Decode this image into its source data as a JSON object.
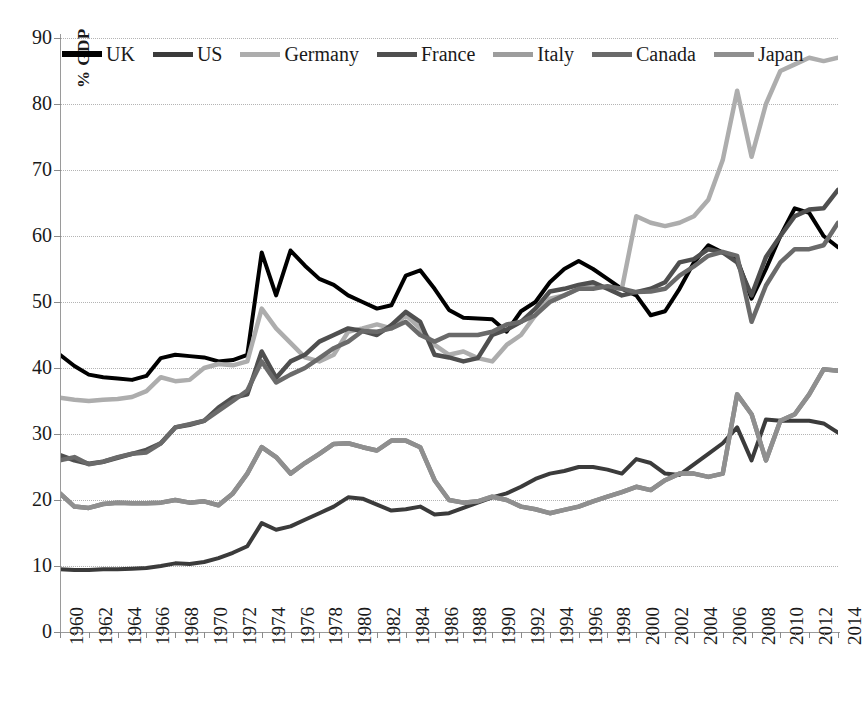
{
  "chart_data": {
    "type": "line",
    "title": "",
    "subtitle": "",
    "xlabel": "",
    "ylabel": "% GDP",
    "ylim": [
      0,
      90
    ],
    "xlim": [
      1960,
      2014
    ],
    "ytick_step": 10,
    "xtick_step": 2,
    "grid": true,
    "grid_style": "dotted-horizontal",
    "legend_position": "top-inside",
    "yticks": [
      0,
      10,
      20,
      30,
      40,
      50,
      60,
      70,
      80,
      90
    ],
    "xticks": [
      1960,
      1962,
      1964,
      1966,
      1968,
      1970,
      1972,
      1974,
      1976,
      1978,
      1980,
      1982,
      1984,
      1986,
      1988,
      1990,
      1992,
      1994,
      1996,
      1998,
      2000,
      2002,
      2004,
      2006,
      2008,
      2010,
      2012,
      2014
    ],
    "x": [
      1960,
      1961,
      1962,
      1963,
      1964,
      1965,
      1966,
      1967,
      1968,
      1969,
      1970,
      1971,
      1972,
      1973,
      1974,
      1975,
      1976,
      1977,
      1978,
      1979,
      1980,
      1981,
      1982,
      1983,
      1984,
      1985,
      1986,
      1987,
      1988,
      1989,
      1990,
      1991,
      1992,
      1993,
      1994,
      1995,
      1996,
      1997,
      1998,
      1999,
      2000,
      2001,
      2002,
      2003,
      2004,
      2005,
      2006,
      2007,
      2008,
      2009,
      2010,
      2011,
      2012,
      2013,
      2014
    ],
    "series": [
      {
        "name": "UK",
        "color": "#000000",
        "width": 4.0,
        "values": [
          42.0,
          40.3,
          39.0,
          38.6,
          38.4,
          38.2,
          38.8,
          41.5,
          42.0,
          41.8,
          41.6,
          41.0,
          41.2,
          42.0,
          57.5,
          51.0,
          57.8,
          55.5,
          53.5,
          52.6,
          51.0,
          50.0,
          49.0,
          49.5,
          54.0,
          54.8,
          52.0,
          48.8,
          47.6,
          47.5,
          47.4,
          45.5,
          48.6,
          50.0,
          53.0,
          55.0,
          56.2,
          55.0,
          53.5,
          52.0,
          51.0,
          48.0,
          48.6,
          52.0,
          56.0,
          58.6,
          57.5,
          56.5,
          50.5,
          55.0,
          60.0,
          64.2,
          63.5,
          60.0,
          58.3
        ]
      },
      {
        "name": "US",
        "color": "#3b3b3b",
        "width": 4.0,
        "values": [
          9.5,
          9.4,
          9.4,
          9.5,
          9.5,
          9.6,
          9.7,
          10.0,
          10.4,
          10.3,
          10.6,
          11.2,
          12.0,
          13.0,
          16.5,
          15.5,
          16.0,
          17.0,
          18.0,
          19.0,
          20.4,
          20.2,
          19.3,
          18.4,
          18.6,
          19.0,
          17.8,
          18.0,
          18.8,
          19.6,
          20.4,
          21.0,
          22.0,
          23.2,
          24.0,
          24.4,
          25.0,
          25.0,
          24.6,
          24.0,
          26.2,
          25.6,
          24.0,
          23.8,
          25.4,
          27.0,
          28.6,
          31.0,
          26.0,
          32.2,
          32.0,
          32.0,
          32.0,
          31.6,
          30.2
        ]
      },
      {
        "name": "Germany",
        "color": "#adadad",
        "width": 4.5,
        "values": [
          35.5,
          35.2,
          35.0,
          35.2,
          35.3,
          35.6,
          36.5,
          38.6,
          38.0,
          38.2,
          40.0,
          40.6,
          40.4,
          41.0,
          49.0,
          46.0,
          43.8,
          41.6,
          41.0,
          42.0,
          45.5,
          46.0,
          46.6,
          46.0,
          48.0,
          46.0,
          43.5,
          42.0,
          42.5,
          41.5,
          41.0,
          43.5,
          45.0,
          48.0,
          50.5,
          51.0,
          52.0,
          52.4,
          52.2,
          52.0,
          63.0,
          62.0,
          61.5,
          62.0,
          63.0,
          65.5,
          71.5,
          82.0,
          72.0,
          80.0,
          85.0,
          86.0,
          87.0,
          86.5,
          87.0
        ]
      },
      {
        "name": "France",
        "color": "#4f4f4f",
        "width": 4.5,
        "values": [
          26.8,
          26.0,
          25.5,
          25.8,
          26.4,
          27.0,
          27.6,
          28.6,
          31.0,
          31.4,
          32.0,
          34.0,
          35.5,
          36.0,
          42.5,
          38.5,
          41.0,
          42.0,
          44.0,
          45.0,
          46.0,
          45.6,
          45.0,
          46.5,
          48.5,
          47.0,
          42.0,
          41.6,
          41.0,
          41.5,
          45.0,
          45.8,
          47.0,
          49.0,
          51.6,
          52.0,
          52.6,
          53.0,
          52.0,
          51.0,
          51.5,
          52.0,
          53.0,
          56.0,
          56.5,
          58.0,
          57.5,
          56.0,
          51.0,
          56.8,
          60.0,
          63.0,
          64.0,
          64.2,
          67.0
        ]
      },
      {
        "name": "Italy",
        "color": "#7f7f7f",
        "width": 4.5,
        "values": [
          21.0,
          19.0,
          18.8,
          19.4,
          19.6,
          19.5,
          19.5,
          19.6,
          20.0,
          19.6,
          19.8,
          19.2,
          21.0,
          24.0,
          28.0,
          26.5,
          24.0,
          25.6,
          27.0,
          28.5,
          28.6,
          28.0,
          27.5,
          29.0,
          29.0,
          28.0,
          23.0,
          20.0,
          19.6,
          19.8,
          20.5,
          20.0,
          19.0,
          18.6,
          18.0,
          18.5,
          19.0,
          19.8,
          20.5,
          21.2,
          22.0,
          21.5,
          23.0,
          24.0,
          24.0,
          23.5,
          24.0,
          36.0,
          33.0,
          26.0,
          32.0,
          33.0,
          36.0,
          39.8,
          39.6
        ]
      },
      {
        "name": "Canada",
        "color": "#6a6a6a",
        "width": 4.5,
        "values": [
          26.0,
          26.5,
          25.4,
          25.8,
          26.5,
          27.0,
          27.2,
          28.6,
          31.0,
          31.5,
          32.0,
          33.5,
          35.0,
          36.6,
          41.0,
          37.8,
          39.0,
          40.0,
          41.5,
          43.0,
          44.0,
          45.6,
          45.5,
          46.0,
          47.0,
          45.0,
          44.0,
          45.0,
          45.0,
          45.0,
          45.5,
          46.6,
          47.0,
          48.0,
          50.0,
          51.0,
          52.0,
          52.0,
          52.4,
          52.0,
          51.5,
          51.6,
          52.0,
          54.0,
          55.4,
          57.0,
          57.6,
          57.0,
          47.0,
          52.5,
          56.0,
          58.0,
          58.0,
          58.6,
          62.0
        ]
      },
      {
        "name": "Japan",
        "color": "#8f8f8f",
        "width": 4.5,
        "values": [
          21.0,
          19.0,
          18.8,
          19.4,
          19.6,
          19.5,
          19.5,
          19.6,
          20.0,
          19.6,
          19.8,
          19.2,
          21.0,
          24.0,
          28.0,
          26.5,
          24.0,
          25.6,
          27.0,
          28.5,
          28.6,
          28.0,
          27.5,
          29.0,
          29.0,
          28.0,
          23.0,
          20.0,
          19.6,
          19.8,
          20.5,
          20.0,
          19.0,
          18.6,
          18.0,
          18.5,
          19.0,
          19.8,
          20.5,
          21.2,
          22.0,
          21.5,
          23.0,
          24.0,
          24.0,
          23.5,
          24.0,
          36.0,
          33.0,
          26.0,
          32.0,
          33.0,
          36.0,
          39.8,
          39.6
        ]
      }
    ]
  },
  "legend": {
    "items": [
      {
        "label": "UK",
        "color": "#000000"
      },
      {
        "label": "US",
        "color": "#3b3b3b"
      },
      {
        "label": "Germany",
        "color": "#adadad"
      },
      {
        "label": "France",
        "color": "#4f4f4f"
      },
      {
        "label": "Italy",
        "color": "#9d9d9d"
      },
      {
        "label": "Canada",
        "color": "#6a6a6a"
      },
      {
        "label": "Japan",
        "color": "#8f8f8f"
      }
    ]
  },
  "axes": {
    "y_title": "% GDP",
    "y_labels": [
      "90",
      "80",
      "70",
      "60",
      "50",
      "40",
      "30",
      "20",
      "10",
      "0"
    ],
    "x_labels": [
      "1960",
      "1962",
      "1964",
      "1966",
      "1968",
      "1970",
      "1972",
      "1974",
      "1976",
      "1978",
      "1980",
      "1982",
      "1984",
      "1986",
      "1988",
      "1990",
      "1992",
      "1994",
      "1996",
      "1998",
      "2000",
      "2002",
      "2004",
      "2006",
      "2008",
      "2010",
      "2012",
      "2014"
    ]
  }
}
